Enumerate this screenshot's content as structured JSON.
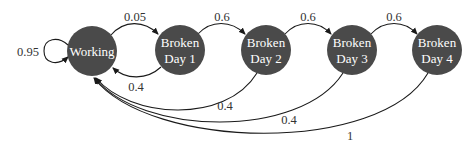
{
  "diagram": {
    "type": "markov-chain",
    "colors": {
      "node_fill": "#4a4a4a",
      "node_text": "#ffffff",
      "edge": "#1a1a1a",
      "label": "#333333"
    },
    "nodes": [
      {
        "id": "working",
        "line1": "Working",
        "line2": ""
      },
      {
        "id": "day1",
        "line1": "Broken",
        "line2": "Day 1"
      },
      {
        "id": "day2",
        "line1": "Broken",
        "line2": "Day 2"
      },
      {
        "id": "day3",
        "line1": "Broken",
        "line2": "Day 3"
      },
      {
        "id": "day4",
        "line1": "Broken",
        "line2": "Day 4"
      }
    ],
    "edges": [
      {
        "from": "working",
        "to": "working",
        "label": "0.95"
      },
      {
        "from": "working",
        "to": "day1",
        "label": "0.05"
      },
      {
        "from": "day1",
        "to": "working",
        "label": "0.4"
      },
      {
        "from": "day1",
        "to": "day2",
        "label": "0.6"
      },
      {
        "from": "day2",
        "to": "working",
        "label": "0.4"
      },
      {
        "from": "day2",
        "to": "day3",
        "label": "0.6"
      },
      {
        "from": "day3",
        "to": "working",
        "label": "0.4"
      },
      {
        "from": "day3",
        "to": "day4",
        "label": "0.6"
      },
      {
        "from": "day4",
        "to": "working",
        "label": "1"
      }
    ]
  }
}
